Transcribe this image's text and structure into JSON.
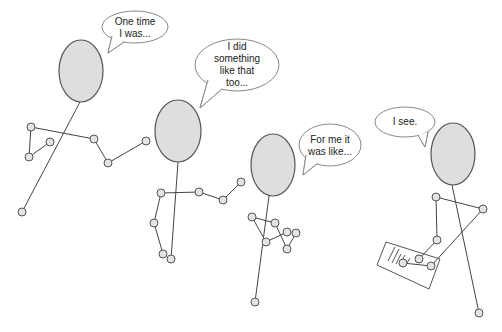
{
  "colors": {
    "head_fill": "#dedede",
    "line": "#444444",
    "joint_fill": "#e4e4e4",
    "bubble_stroke": "#888888",
    "background": "#ffffff"
  },
  "figures": [
    {
      "name": "figure-1",
      "head": {
        "cx": 81,
        "cy": 71,
        "rx": 22,
        "ry": 31
      },
      "body": [
        [
          80,
          102
        ],
        [
          22,
          212
        ]
      ],
      "limbs": [
        [
          [
            31,
            127
          ],
          [
            94,
            139
          ]
        ],
        [
          [
            31,
            127
          ],
          [
            29,
            157
          ]
        ],
        [
          [
            29,
            157
          ],
          [
            50,
            142
          ]
        ],
        [
          [
            94,
            139
          ],
          [
            108,
            163
          ]
        ],
        [
          [
            108,
            163
          ],
          [
            146,
            141
          ]
        ]
      ],
      "joints": [
        [
          31,
          127
        ],
        [
          29,
          157
        ],
        [
          50,
          142
        ],
        [
          94,
          139
        ],
        [
          108,
          163
        ],
        [
          146,
          141
        ],
        [
          22,
          212
        ]
      ],
      "bubble": {
        "cx": 135,
        "cy": 27,
        "rx": 33,
        "ry": 16,
        "tail": [
          [
            112,
            36
          ],
          [
            108,
            53
          ],
          [
            124,
            42
          ]
        ],
        "text": "One time\nI was...",
        "text_box": {
          "x": 103,
          "y": 15,
          "w": 64,
          "h": 26
        }
      }
    },
    {
      "name": "figure-2",
      "head": {
        "cx": 178,
        "cy": 131,
        "rx": 23,
        "ry": 31
      },
      "body": [
        [
          178,
          162
        ],
        [
          171,
          259
        ]
      ],
      "limbs": [
        [
          [
            161,
            193
          ],
          [
            199,
            192
          ]
        ],
        [
          [
            199,
            192
          ],
          [
            223,
            200
          ]
        ],
        [
          [
            223,
            200
          ],
          [
            241,
            182
          ]
        ],
        [
          [
            161,
            193
          ],
          [
            154,
            223
          ]
        ],
        [
          [
            154,
            223
          ],
          [
            163,
            254
          ]
        ]
      ],
      "joints": [
        [
          161,
          193
        ],
        [
          199,
          192
        ],
        [
          223,
          200
        ],
        [
          241,
          182
        ],
        [
          154,
          223
        ],
        [
          163,
          254
        ],
        [
          171,
          259
        ]
      ],
      "bubble": {
        "cx": 237,
        "cy": 65,
        "rx": 42,
        "ry": 26,
        "tail": [
          [
            208,
            80
          ],
          [
            200,
            108
          ],
          [
            222,
            89
          ]
        ],
        "text": "I did\nsomething\nlike that\ntoo...",
        "text_box": {
          "x": 197,
          "y": 41,
          "w": 80,
          "h": 48
        }
      }
    },
    {
      "name": "figure-3",
      "head": {
        "cx": 273,
        "cy": 165,
        "rx": 22,
        "ry": 31
      },
      "body": [
        [
          269,
          196
        ],
        [
          255,
          302
        ]
      ],
      "limbs": [
        [
          [
            252,
            217
          ],
          [
            275,
            223
          ]
        ],
        [
          [
            252,
            217
          ],
          [
            266,
            242
          ]
        ],
        [
          [
            266,
            242
          ],
          [
            287,
            232
          ]
        ],
        [
          [
            275,
            223
          ],
          [
            287,
            249
          ]
        ],
        [
          [
            287,
            249
          ],
          [
            296,
            233
          ]
        ]
      ],
      "joints": [
        [
          252,
          217
        ],
        [
          275,
          223
        ],
        [
          266,
          242
        ],
        [
          287,
          232
        ],
        [
          296,
          233
        ],
        [
          287,
          249
        ],
        [
          255,
          302
        ]
      ],
      "bubble": {
        "cx": 330,
        "cy": 145,
        "rx": 31,
        "ry": 21,
        "tail": [
          [
            306,
            155
          ],
          [
            303,
            175
          ],
          [
            318,
            163
          ]
        ],
        "text": "For me it\nwas like...",
        "text_box": {
          "x": 300,
          "y": 133,
          "w": 60,
          "h": 26
        }
      }
    },
    {
      "name": "figure-4",
      "head": {
        "cx": 453,
        "cy": 154,
        "rx": 22,
        "ry": 31
      },
      "body": [
        [
          452,
          185
        ],
        [
          479,
          313
        ]
      ],
      "limbs": [
        [
          [
            436,
            197
          ],
          [
            483,
            209
          ]
        ],
        [
          [
            436,
            197
          ],
          [
            437,
            240
          ]
        ],
        [
          [
            437,
            240
          ],
          [
            419,
            259
          ]
        ],
        [
          [
            483,
            209
          ],
          [
            431,
            266
          ]
        ],
        [
          [
            431,
            266
          ],
          [
            403,
            263
          ]
        ]
      ],
      "joints": [
        [
          436,
          197
        ],
        [
          483,
          209
        ],
        [
          437,
          240
        ],
        [
          419,
          259
        ],
        [
          431,
          266
        ],
        [
          403,
          263
        ],
        [
          479,
          313
        ]
      ],
      "bubble": {
        "cx": 405,
        "cy": 122,
        "rx": 30,
        "ry": 15,
        "tail": [
          [
            418,
            135
          ],
          [
            425,
            147
          ],
          [
            428,
            132
          ]
        ],
        "text": "I see.",
        "text_box": {
          "x": 376,
          "y": 115,
          "w": 58,
          "h": 14
        }
      },
      "notepad": {
        "corners": [
          [
            386,
            242
          ],
          [
            440,
            259
          ],
          [
            429,
            289
          ],
          [
            377,
            265
          ]
        ],
        "writing": [
          [
            [
              388,
              261
            ],
            [
              395,
              247
            ]
          ],
          [
            [
              392,
              263
            ],
            [
              399,
              249
            ]
          ],
          [
            [
              396,
              264
            ],
            [
              401,
              254
            ]
          ],
          [
            [
              401,
              262
            ],
            [
              405,
              255
            ]
          ],
          [
            [
              405,
              266
            ],
            [
              410,
              258
            ]
          ]
        ]
      }
    }
  ]
}
